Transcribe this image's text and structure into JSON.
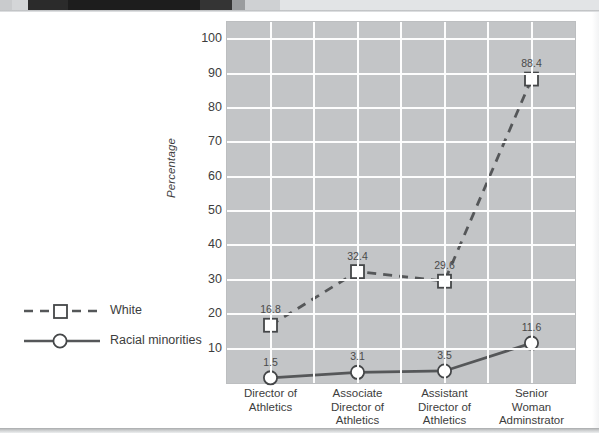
{
  "figure": {
    "y_axis_title": "Percentage"
  },
  "chart_data": {
    "type": "line",
    "title": "",
    "xlabel": "",
    "ylabel": "Percentage",
    "ylim": [
      0,
      105
    ],
    "yticks": [
      10,
      20,
      30,
      40,
      50,
      60,
      70,
      80,
      90,
      100
    ],
    "grid": true,
    "legend_position": "left",
    "categories": [
      "Director of\nAthletics",
      "Associate\nDirector of\nAthletics",
      "Assistant\nDirector of\nAthletics",
      "Senior\nWoman\nAdminstrator"
    ],
    "category_lines": [
      [
        "Director of",
        "Athletics"
      ],
      [
        "Associate",
        "Director of",
        "Athletics"
      ],
      [
        "Assistant",
        "Director of",
        "Athletics"
      ],
      [
        "Senior",
        "Woman",
        "Adminstrator"
      ]
    ],
    "series": [
      {
        "name": "White",
        "values": [
          16.8,
          32.4,
          29.6,
          88.4
        ],
        "labels": [
          "16.8",
          "32.4",
          "29.6",
          "88.4"
        ],
        "line_style": "dashed",
        "marker": "square",
        "color": "#555759"
      },
      {
        "name": "Racial minorities",
        "values": [
          1.5,
          3.1,
          3.5,
          11.6
        ],
        "labels": [
          "1.5",
          "3.1",
          "3.5",
          "11.6"
        ],
        "line_style": "solid",
        "marker": "circle",
        "color": "#555759"
      }
    ]
  },
  "colors": {
    "plot_background": "#c3c5c7",
    "gridline": "#fdfdfd",
    "series_line": "#555759",
    "marker_fill": "#ffffff",
    "text": "#3d3d3d",
    "page_background": "#ffffff"
  },
  "legend": {
    "items": [
      {
        "label": "White",
        "style": "dashed-square"
      },
      {
        "label": "Racial minorities",
        "style": "solid-circle"
      }
    ]
  }
}
